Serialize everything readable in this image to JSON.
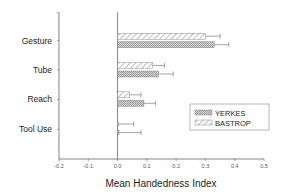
{
  "chart_data": {
    "type": "bar",
    "orientation": "horizontal",
    "title": "",
    "xlabel": "Mean Handedness Index",
    "ylabel": "",
    "xlim": [
      -0.2,
      0.5
    ],
    "xticks": [
      "-0.2",
      "-0.1",
      "0.0",
      "0.1",
      "0.2",
      "0.3",
      "0.4",
      "0.5"
    ],
    "categories": [
      "Gesture",
      "Tube",
      "Reach",
      "Tool Use"
    ],
    "series": [
      {
        "name": "BASTROP",
        "pattern": "diagonal-hatch",
        "values": [
          0.3,
          0.12,
          0.04,
          0.003
        ],
        "error": [
          0.05,
          0.04,
          0.04,
          0.052
        ]
      },
      {
        "name": "YERKES",
        "pattern": "crosshatch-gray",
        "values": [
          0.33,
          0.14,
          0.09,
          0.005
        ],
        "error": [
          0.05,
          0.05,
          0.04,
          0.075
        ]
      }
    ],
    "legend": {
      "position": "lower-right",
      "entries": [
        "YERKES",
        "BASTROP"
      ]
    },
    "grid": false
  },
  "axis": {
    "x_title": "Mean Handedness Index"
  },
  "legend": {
    "items": [
      {
        "label": "YERKES",
        "pattern": "crosshatch-gray"
      },
      {
        "label": "BASTROP",
        "pattern": "diagonal-hatch"
      }
    ]
  },
  "colors": {
    "axis": "#555555",
    "bar_stroke": "#666666",
    "yerkes_fill": "#bdbdbd",
    "bastrop_fill": "#ffffff",
    "text": "#222222"
  }
}
